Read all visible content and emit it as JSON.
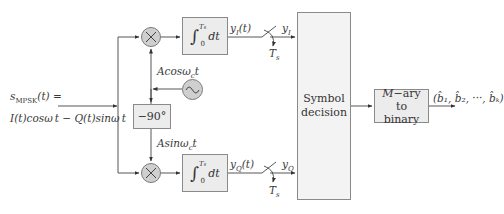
{
  "diagram": {
    "input": {
      "line1": "s",
      "line1_sub": "MPSK",
      "line1_rest": "(t) =",
      "line2": "I(t)cosω t − Q(t)sinω t",
      "line2_sub": "c"
    },
    "multipliers": [
      {
        "id": "mixer-I",
        "symbol": "×"
      },
      {
        "id": "mixer-Q",
        "symbol": "×"
      }
    ],
    "oscillator": {
      "symbol": "~"
    },
    "phase_shift": {
      "label": "−90°"
    },
    "carrier_labels": {
      "cos": "Acosω",
      "cos_sub": "c",
      "cos_t": "t",
      "sin": "Asinω",
      "sin_sub": "c",
      "sin_t": "t"
    },
    "integrators": [
      {
        "id": "integrator-I",
        "upper": "T",
        "upper_sub": "s",
        "lower": "0",
        "body": "dt"
      },
      {
        "id": "integrator-Q",
        "upper": "T",
        "upper_sub": "s",
        "lower": "0",
        "body": "dt"
      }
    ],
    "signals": {
      "yI_t": "y",
      "yI_t_sub": "I",
      "yI_t_rest": "(t)",
      "yI": "y",
      "yI_sub": "I",
      "yQ_t": "y",
      "yQ_t_sub": "Q",
      "yQ_t_rest": "(t)",
      "yQ": "y",
      "yQ_sub": "Q",
      "sample_top": "T",
      "sample_top_sub": "s",
      "sample_bottom": "T",
      "sample_bottom_sub": "s"
    },
    "decision": {
      "line1": "Symbol",
      "line2": "decision"
    },
    "mary": {
      "line1_italic": "M",
      "line1_rest": "−ary to",
      "line2": "binary"
    },
    "output": {
      "label": "(b̂₁, b̂₂, ···, b̂ₖ)"
    }
  }
}
